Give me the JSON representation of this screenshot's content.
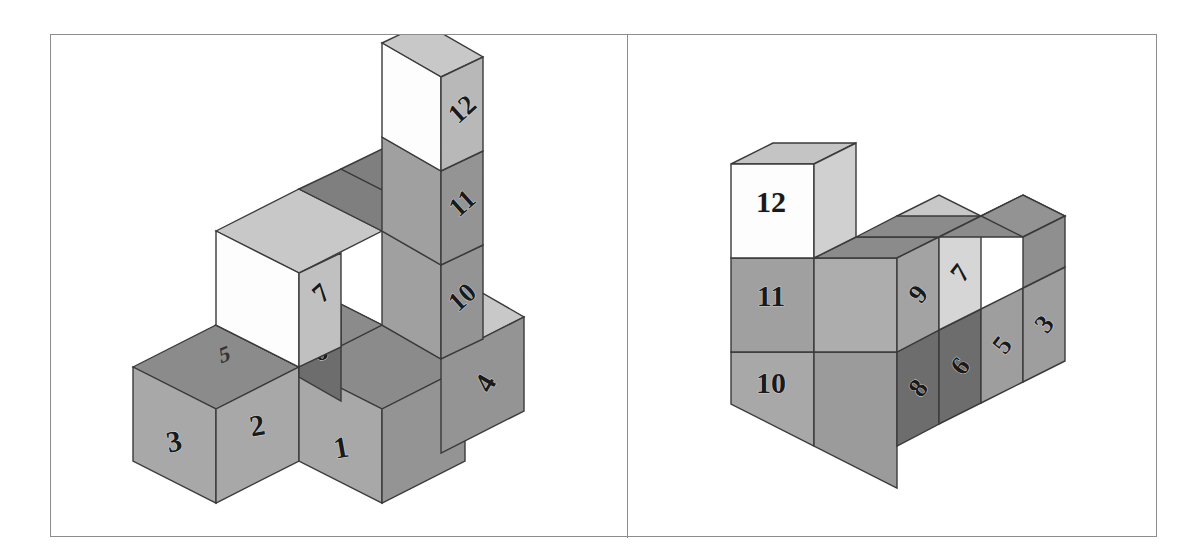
{
  "figure": {
    "type": "isometric-cube-diagram",
    "panel_count": 2,
    "frame_color": "#8d8d8d",
    "background_color": "#ffffff",
    "cube_count_per_panel": 12
  },
  "palette": {
    "top_dark": "#8b8b8b",
    "top_mid": "#a0a0a0",
    "top_light": "#c8c8c8",
    "front_mid": "#a8a8a8",
    "front_dark": "#6d6d6d",
    "front_light": "#d6d6d6",
    "front_white": "#fdfdfd",
    "side_mid": "#949494",
    "side_dark": "#6a6a6a",
    "side_light": "#c0c0c0",
    "outline": "#3a3a3a"
  },
  "left_panel": {
    "name": "left-structure",
    "labels": {
      "front_row": [
        "3",
        "2",
        "1"
      ],
      "right_lower": "4",
      "mid_front": "6",
      "mid_side": "7",
      "tower_side": [
        "12",
        "11",
        "10"
      ],
      "top_smudge": "5"
    },
    "cubes": [
      {
        "id": "L-c3",
        "label": "3",
        "face": "front",
        "tone": "mid"
      },
      {
        "id": "L-c2",
        "label": "2",
        "face": "front",
        "tone": "mid"
      },
      {
        "id": "L-c1",
        "label": "1",
        "face": "front",
        "tone": "mid"
      },
      {
        "id": "L-c4",
        "label": "4",
        "face": "side",
        "tone": "mid"
      },
      {
        "id": "L-c5",
        "label": "5",
        "face": "top",
        "tone": "smudge"
      },
      {
        "id": "L-c6",
        "label": "6",
        "face": "front",
        "tone": "dark"
      },
      {
        "id": "L-c7",
        "label": "7",
        "face": "side",
        "tone": "light"
      },
      {
        "id": "L-c10",
        "label": "10",
        "face": "side",
        "tone": "mid"
      },
      {
        "id": "L-c11",
        "label": "11",
        "face": "side",
        "tone": "mid"
      },
      {
        "id": "L-c12",
        "label": "12",
        "face": "side",
        "tone": "mid"
      }
    ]
  },
  "right_panel": {
    "name": "right-structure",
    "labels": {
      "tower_front": [
        "12",
        "11",
        "10"
      ],
      "front_row": [
        "8",
        "6",
        "5",
        "3"
      ],
      "side_row": [
        "9",
        "7"
      ]
    },
    "cubes": [
      {
        "id": "R-c12",
        "label": "12",
        "face": "front",
        "tone": "white"
      },
      {
        "id": "R-c11",
        "label": "11",
        "face": "front",
        "tone": "mid"
      },
      {
        "id": "R-c10",
        "label": "10",
        "face": "front",
        "tone": "mid"
      },
      {
        "id": "R-c9",
        "label": "9",
        "face": "side",
        "tone": "mid"
      },
      {
        "id": "R-c8",
        "label": "8",
        "face": "side",
        "tone": "dark"
      },
      {
        "id": "R-c7",
        "label": "7",
        "face": "side",
        "tone": "light"
      },
      {
        "id": "R-c6",
        "label": "6",
        "face": "side",
        "tone": "dark"
      },
      {
        "id": "R-c5",
        "label": "5",
        "face": "side",
        "tone": "mid"
      },
      {
        "id": "R-c3",
        "label": "3",
        "face": "side",
        "tone": "mid"
      }
    ]
  }
}
